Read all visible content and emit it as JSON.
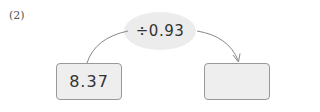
{
  "problem_label": "(2)",
  "operation": {
    "text": "÷0.93",
    "bubble_color": "#ececec"
  },
  "input_box": {
    "value": "8.37"
  },
  "output_box": {
    "value": ""
  },
  "colors": {
    "box_fill": "#eeeeee",
    "box_border": "#999999",
    "arrow": "#888888",
    "text": "#333333"
  }
}
